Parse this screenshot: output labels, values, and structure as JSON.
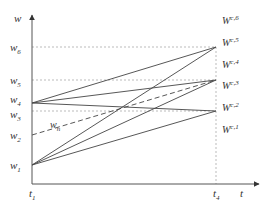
{
  "diagram": {
    "type": "line-diagram",
    "axes": {
      "y_label": "w",
      "x_label": "t",
      "y_ticks": [
        {
          "base": "w",
          "sub": "6",
          "y": 47
        },
        {
          "base": "w",
          "sub": "5",
          "y": 80
        },
        {
          "base": "w",
          "sub": "4",
          "y": 103
        },
        {
          "base": "w",
          "sub": "3",
          "y": 111
        },
        {
          "base": "w",
          "sub": "2",
          "y": 135
        },
        {
          "base": "w",
          "sub": "1",
          "y": 165
        }
      ],
      "x_ticks": [
        {
          "base": "t",
          "sub": "1",
          "x": 32
        },
        {
          "base": "t",
          "sub": "4",
          "x": 216
        }
      ]
    },
    "right_labels": [
      {
        "base": "W",
        "sup": "c,6",
        "y": 24
      },
      {
        "base": "W",
        "sup": "c,5",
        "y": 46
      },
      {
        "base": "W",
        "sup": "c,4",
        "y": 68
      },
      {
        "base": "W",
        "sup": "c,3",
        "y": 89
      },
      {
        "base": "W",
        "sup": "c,2",
        "y": 111
      },
      {
        "base": "W",
        "sup": "c,1",
        "y": 133
      }
    ],
    "dashed_curve_label": {
      "base": "w",
      "sub": "n"
    },
    "colors": {
      "line": "#444444",
      "axis": "#555555",
      "guide": "#aaaaaa",
      "text": "#333333"
    }
  }
}
